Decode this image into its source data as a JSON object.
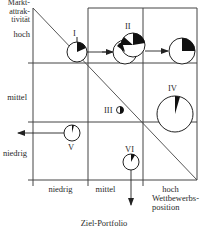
{
  "title": "Ziel-Portfolio",
  "y_axis": {
    "label_lines": [
      "Markt-",
      "attrak-",
      "tivität"
    ],
    "levels": [
      "hoch",
      "mittel",
      "niedrig"
    ]
  },
  "x_axis": {
    "levels": [
      "niedrig",
      "mittel",
      "hoch"
    ],
    "label_lines": [
      "Wettbewerbs-",
      "position"
    ]
  },
  "units": [
    {
      "id": "I",
      "label": "I",
      "cell": "hoch/mittel-boundary",
      "movement": "right"
    },
    {
      "id": "II",
      "label": "II",
      "cell": "hoch/mittel",
      "movement": "right"
    },
    {
      "id": "III",
      "label": "III",
      "cell": "mittel/mittel",
      "movement": "none"
    },
    {
      "id": "IV",
      "label": "IV",
      "cell": "mittel/hoch",
      "movement": "none"
    },
    {
      "id": "V",
      "label": "V",
      "cell": "niedrig/niedrig",
      "movement": "left"
    },
    {
      "id": "VI",
      "label": "VI",
      "cell": "niedrig/mittel",
      "movement": "down"
    }
  ],
  "colors": {
    "line": "#333333",
    "fill": "#111111",
    "background": "#ffffff"
  }
}
